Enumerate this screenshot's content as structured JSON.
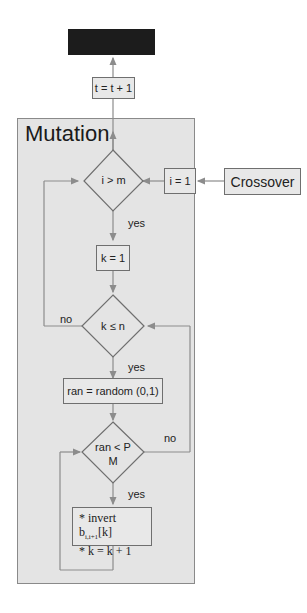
{
  "diagram": {
    "top_box": {
      "label": ""
    },
    "increment": {
      "label": "t = t + 1"
    },
    "panel": {
      "title": "Mutation"
    },
    "crossover": {
      "label": "Crossover"
    },
    "init_i": {
      "label": "i = 1"
    },
    "decision_i": {
      "label": "i > m"
    },
    "yes1": "yes",
    "init_k": {
      "label": "k = 1"
    },
    "decision_k": {
      "label": "k ≤ n"
    },
    "no1": "no",
    "yes2": "yes",
    "random": {
      "label": "ran = random (0,1)"
    },
    "decision_ran": {
      "line1": "ran < P",
      "line2": "M"
    },
    "no2": "no",
    "yes3": "yes",
    "action": {
      "line1_prefix": "* invert b",
      "line1_sub": "i,i+1",
      "line1_suffix": "[k]",
      "line2": "* k = k + 1"
    },
    "colors": {
      "panel": "#e4e4e4",
      "line": "#8c8c8c",
      "box_border": "#6f6f6f",
      "top_box": "#1c1c1c"
    }
  }
}
